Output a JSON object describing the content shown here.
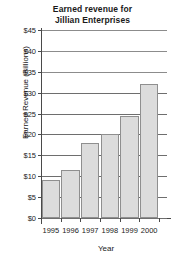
{
  "chart_data": {
    "type": "bar",
    "title": "Earned revenue for Jillian Enterprises",
    "title_lines": [
      "Earned revenue for",
      "Jillian Enterprises"
    ],
    "xlabel": "Year",
    "ylabel": "Earned Revenue (Billions)",
    "categories": [
      "1995",
      "1996",
      "1997",
      "1998",
      "1999",
      "2000"
    ],
    "values": [
      9,
      11.5,
      18,
      20,
      24.5,
      32
    ],
    "ylim": [
      0,
      45
    ],
    "ytick_values": [
      0,
      5,
      10,
      15,
      20,
      25,
      30,
      35,
      40,
      45
    ],
    "ytick_labels": [
      "$0",
      "$5",
      "$10",
      "$15",
      "$20",
      "$25",
      "$30",
      "$35",
      "$40",
      "$45"
    ],
    "grid": true,
    "grid_axis": "y",
    "legend": null,
    "bar_fill": "#dcdcdc",
    "bar_border": "#8f8f8f",
    "grid_color": "#6e6e6e",
    "axis_color": "#4a4a4a",
    "text_color": "#1a1a1a",
    "series": [
      {
        "name": "Earned Revenue",
        "values": [
          9,
          11.5,
          18,
          20,
          24.5,
          32
        ]
      }
    ],
    "points": [
      {
        "category": "1995",
        "value": 9
      },
      {
        "category": "1996",
        "value": 11.5
      },
      {
        "category": "1997",
        "value": 18
      },
      {
        "category": "1998",
        "value": 20
      },
      {
        "category": "1999",
        "value": 24.5
      },
      {
        "category": "2000",
        "value": 32
      }
    ]
  }
}
